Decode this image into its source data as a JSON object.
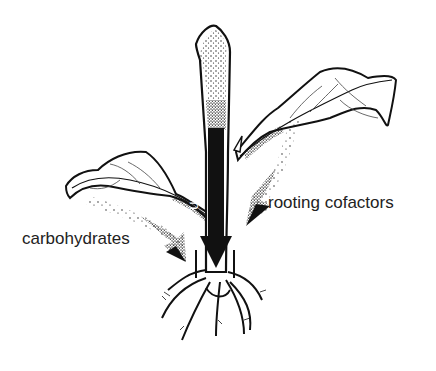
{
  "diagram": {
    "labels": {
      "auxin": "auxin",
      "rooting_cofactors": "rooting cofactors",
      "carbohydrates": "carbohydrates"
    },
    "colors": {
      "ink": "#111111",
      "background": "#ffffff",
      "label_text": "#222222"
    },
    "arrows": [
      {
        "name": "auxin-arrow",
        "direction": "down",
        "style": "solid black"
      },
      {
        "name": "rooting-cofactors-arrow",
        "direction": "down-left",
        "style": "stippled"
      },
      {
        "name": "carbohydrates-arrow",
        "direction": "down-right",
        "style": "stippled"
      }
    ]
  }
}
